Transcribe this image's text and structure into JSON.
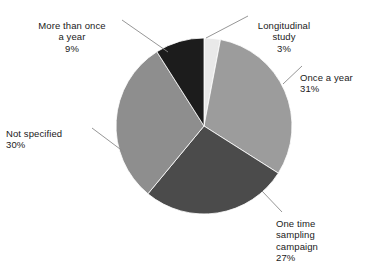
{
  "chart_data": {
    "type": "pie",
    "title": "",
    "subtitle": "",
    "xlabel": "",
    "ylabel": "",
    "legend_position": "callout-labels",
    "grid": false,
    "start_angle_deg": 0,
    "direction": "clockwise",
    "center": {
      "x": 204,
      "y": 126
    },
    "radius": 88,
    "categories": [
      "Longitudinal study",
      "Once a year",
      "One time sampling campaign",
      "Not specified",
      "More than once a year"
    ],
    "values": [
      3,
      31,
      27,
      30,
      9
    ],
    "unit": "%",
    "slices": [
      {
        "label": "Longitudinal\nstudy",
        "label_plain": "Longitudinal study",
        "value": 3,
        "percent_text": "3%",
        "color": "#e9e9e9",
        "leader": {
          "x1": 206,
          "y1": 38,
          "x2": 248,
          "y2": 16
        }
      },
      {
        "label": "Once a year",
        "label_plain": "Once a year",
        "value": 31,
        "percent_text": "31%",
        "color": "#9c9c9c",
        "leader": {
          "x1": 283,
          "y1": 84,
          "x2": 302,
          "y2": 66
        }
      },
      {
        "label": "One time\nsampling\ncampaign",
        "label_plain": "One time sampling campaign",
        "value": 27,
        "percent_text": "27%",
        "color": "#4b4b4b",
        "leader": {
          "x1": 262,
          "y1": 191,
          "x2": 282,
          "y2": 212
        }
      },
      {
        "label": "Not specified",
        "label_plain": "Not specified",
        "value": 30,
        "percent_text": "30%",
        "color": "#8e8e8e",
        "leader": {
          "x1": 124,
          "y1": 152,
          "x2": 92,
          "y2": 128
        }
      },
      {
        "label": "More than once\na year",
        "label_plain": "More than once a year",
        "value": 9,
        "percent_text": "9%",
        "color": "#1c1c1c",
        "leader": {
          "x1": 168,
          "y1": 52,
          "x2": 122,
          "y2": 20
        }
      }
    ],
    "colors": {
      "longitudinal_study": "#e9e9e9",
      "once_a_year": "#9c9c9c",
      "one_time_sampling_campaign": "#4b4b4b",
      "not_specified": "#8e8e8e",
      "more_than_once_a_year": "#1c1c1c",
      "background": "#ffffff",
      "text": "#1a1a1a",
      "leader_line": "#8a8a8a"
    }
  },
  "labels": {
    "more_than_once": {
      "text": "More than once\na year",
      "percent": "9%"
    },
    "longitudinal": {
      "text": "Longitudinal\nstudy",
      "percent": "3%"
    },
    "once_a_year": {
      "text": "Once a year",
      "percent": "31%"
    },
    "one_time": {
      "text": "One time\nsampling\ncampaign",
      "percent": "27%"
    },
    "not_specified": {
      "text": "Not specified",
      "percent": "30%"
    }
  }
}
